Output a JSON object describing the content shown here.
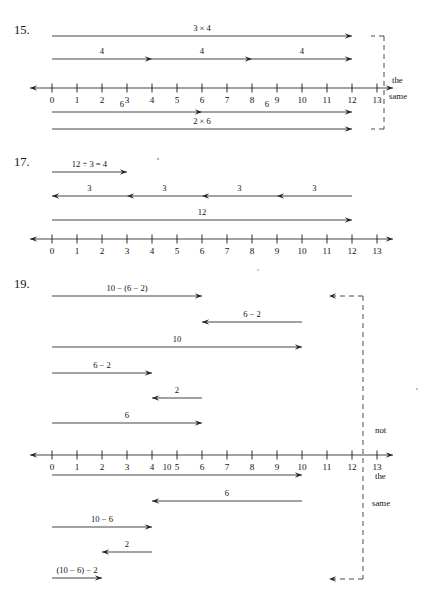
{
  "page": {
    "width": 430,
    "height": 597,
    "background": "#ffffff",
    "ink": "#232323"
  },
  "axis": {
    "x0": 52,
    "unit": 25,
    "min": 0,
    "max": 13,
    "tick_labels": [
      "0",
      "1",
      "2",
      "3",
      "4",
      "5",
      "6",
      "7",
      "8",
      "9",
      "10",
      "11",
      "12",
      "13"
    ],
    "tick_height": 9,
    "left_arrow": true,
    "right_arrow": true
  },
  "problems": [
    {
      "id": "problem-15",
      "number": "15.",
      "number_x": 14,
      "number_y": 34,
      "axis_y": 88,
      "bracket": {
        "x": 384,
        "y_top": 36,
        "y_bottom": 129,
        "top_arrow": false,
        "bottom_arrow": false,
        "stub": 13
      },
      "side_labels": [
        {
          "text": "the",
          "x": 392,
          "y": 83
        },
        {
          "text": "same",
          "x": 389,
          "y": 99
        }
      ],
      "segments": [
        {
          "name": "three-times-four",
          "label": "3 × 4",
          "from": 0,
          "to": 12,
          "y": 36,
          "dir": "right",
          "label_x_units": 6.0,
          "label_dy": -5
        },
        {
          "name": "four-a",
          "label": "4",
          "from": 0,
          "to": 4,
          "y": 59,
          "dir": "right",
          "label_x_units": 2.0,
          "label_dy": -5
        },
        {
          "name": "four-b",
          "label": "4",
          "from": 4,
          "to": 8,
          "y": 59,
          "dir": "right",
          "label_x_units": 6.0,
          "label_dy": -5
        },
        {
          "name": "four-c",
          "label": "4",
          "from": 8,
          "to": 12,
          "y": 59,
          "dir": "right",
          "label_x_units": 10.0,
          "label_dy": -5
        },
        {
          "name": "six-a",
          "label": "6",
          "from": 0,
          "to": 6,
          "y": 112,
          "dir": "right",
          "label_x_units": 2.8,
          "label_dy": -5
        },
        {
          "name": "six-b",
          "label": "6",
          "from": 6,
          "to": 12,
          "y": 112,
          "dir": "right",
          "label_x_units": 8.6,
          "label_dy": -5
        },
        {
          "name": "two-times-six",
          "label": "2 × 6",
          "from": 0,
          "to": 12,
          "y": 129,
          "dir": "right",
          "label_x_units": 6.0,
          "label_dy": -5
        }
      ]
    },
    {
      "id": "problem-17",
      "number": "17.",
      "number_x": 14,
      "number_y": 166,
      "axis_y": 239,
      "bracket": null,
      "side_labels": [],
      "segments": [
        {
          "name": "twelve-div-three",
          "label": "12 ÷ 3 = 4",
          "from": 0,
          "to": 3,
          "y": 172,
          "dir": "right",
          "label_x_units": 1.5,
          "label_dy": -5
        },
        {
          "name": "three-a",
          "label": "3",
          "from": 3,
          "to": 0,
          "y": 196,
          "dir": "left",
          "label_x_units": 1.5,
          "label_dy": -5
        },
        {
          "name": "three-b",
          "label": "3",
          "from": 6,
          "to": 3,
          "y": 196,
          "dir": "left",
          "label_x_units": 4.5,
          "label_dy": -5
        },
        {
          "name": "three-c",
          "label": "3",
          "from": 9,
          "to": 6,
          "y": 196,
          "dir": "left",
          "label_x_units": 7.5,
          "label_dy": -5
        },
        {
          "name": "three-d",
          "label": "3",
          "from": 12,
          "to": 9,
          "y": 196,
          "dir": "left",
          "label_x_units": 10.5,
          "label_dy": -5
        },
        {
          "name": "twelve",
          "label": "12",
          "from": 0,
          "to": 12,
          "y": 220,
          "dir": "right",
          "label_x_units": 6.0,
          "label_dy": -5
        }
      ]
    },
    {
      "id": "problem-19",
      "number": "19.",
      "number_x": 14,
      "number_y": 288,
      "axis_y": 455,
      "bracket": {
        "x": 363,
        "y_top": 296,
        "y_bottom": 579,
        "top_arrow": true,
        "bottom_arrow": true,
        "stub": 34
      },
      "side_labels": [
        {
          "text": "not",
          "x": 375,
          "y": 433
        },
        {
          "text": "the",
          "x": 375,
          "y": 479
        },
        {
          "text": "same",
          "x": 372,
          "y": 506
        }
      ],
      "segments": [
        {
          "name": "ten-minus-six-minus-two",
          "label": "10 − (6 − 2)",
          "from": 0,
          "to": 6,
          "y": 296,
          "dir": "right",
          "label_x_units": 3.0,
          "label_dy": -5
        },
        {
          "name": "six-minus-two-back",
          "label": "6 − 2",
          "from": 10,
          "to": 6,
          "y": 322,
          "dir": "left",
          "label_x_units": 8.0,
          "label_dy": -5
        },
        {
          "name": "ten-top",
          "label": "10",
          "from": 0,
          "to": 10,
          "y": 347,
          "dir": "right",
          "label_x_units": 5.0,
          "label_dy": -5
        },
        {
          "name": "six-minus-two-fwd",
          "label": "6 − 2",
          "from": 0,
          "to": 4,
          "y": 373,
          "dir": "right",
          "label_x_units": 2.0,
          "label_dy": -5
        },
        {
          "name": "two-back-top",
          "label": "2",
          "from": 6,
          "to": 4,
          "y": 398,
          "dir": "left",
          "label_x_units": 5.0,
          "label_dy": -5
        },
        {
          "name": "six-fwd",
          "label": "6",
          "from": 0,
          "to": 6,
          "y": 423,
          "dir": "right",
          "label_x_units": 3.0,
          "label_dy": -5
        },
        {
          "name": "ten-bottom",
          "label": "10",
          "from": 0,
          "to": 10,
          "y": 475,
          "dir": "right",
          "label_x_units": 4.6,
          "label_dy": -5
        },
        {
          "name": "six-back-bottom",
          "label": "6",
          "from": 10,
          "to": 4,
          "y": 501,
          "dir": "left",
          "label_x_units": 7.0,
          "label_dy": -5
        },
        {
          "name": "ten-minus-six",
          "label": "10 − 6",
          "from": 0,
          "to": 4,
          "y": 527,
          "dir": "right",
          "label_x_units": 2.0,
          "label_dy": -5
        },
        {
          "name": "two-back-bottom",
          "label": "2",
          "from": 4,
          "to": 2,
          "y": 552,
          "dir": "left",
          "label_x_units": 3.0,
          "label_dy": -5
        },
        {
          "name": "ten-minus-six-minus-two-result",
          "label": "(10 − 6) − 2",
          "from": 0,
          "to": 2,
          "y": 578,
          "dir": "right",
          "label_x_units": 1.0,
          "label_dy": -5
        }
      ]
    }
  ],
  "specks": [
    {
      "x": 158,
      "y": 159,
      "r": 1.2
    },
    {
      "x": 417,
      "y": 389,
      "r": 1.1
    },
    {
      "x": 258,
      "y": 270,
      "r": 0.9
    }
  ]
}
